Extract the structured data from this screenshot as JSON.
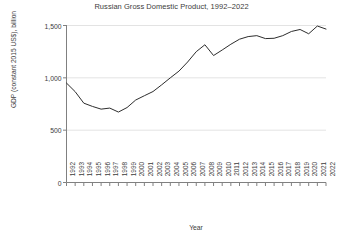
{
  "chart_data": {
    "type": "line",
    "title": "Russian Gross Domestic Product, 1992–2022",
    "xlabel": "Year",
    "ylabel": "GDP (constant 2015 US$), billion",
    "grid": true,
    "legend": null,
    "xlim": [
      1992,
      2022
    ],
    "ylim": [
      0,
      1500
    ],
    "yticks": [
      0,
      500,
      1000,
      1500
    ],
    "ytick_labels": [
      "0",
      "500",
      "1,000",
      "1,500"
    ],
    "categories": [
      "1992",
      "1993",
      "1994",
      "1995",
      "1996",
      "1997",
      "1998",
      "1999",
      "2000",
      "2001",
      "2002",
      "2003",
      "2004",
      "2005",
      "2006",
      "2007",
      "2008",
      "2009",
      "2010",
      "2011",
      "2012",
      "2013",
      "2014",
      "2015",
      "2016",
      "2017",
      "2018",
      "2019",
      "2020",
      "2021",
      "2022"
    ],
    "x": [
      1992,
      1993,
      1994,
      1995,
      1996,
      1997,
      1998,
      1999,
      2000,
      2001,
      2002,
      2003,
      2004,
      2005,
      2006,
      2007,
      2008,
      2009,
      2010,
      2011,
      2012,
      2013,
      2014,
      2015,
      2016,
      2017,
      2018,
      2019,
      2020,
      2021,
      2022
    ],
    "values": [
      950,
      868,
      758,
      727,
      701,
      711,
      673,
      716,
      788,
      829,
      869,
      933,
      1000,
      1064,
      1151,
      1250,
      1316,
      1213,
      1266,
      1321,
      1369,
      1394,
      1403,
      1375,
      1378,
      1403,
      1443,
      1462,
      1421,
      1495,
      1466
    ],
    "line_color": "#2d2d2d",
    "grid_color": "#e3e3e3",
    "axis_color": "#808080",
    "annotations": []
  }
}
